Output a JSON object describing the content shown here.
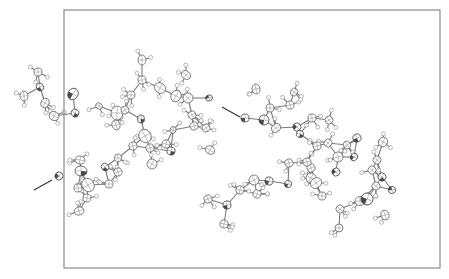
{
  "figure": {
    "type": "crystal-packing-diagram",
    "style": "ORTEP thermal ellipsoids with hydrogen atoms",
    "unit_cell_frame": {
      "x": 64,
      "y": 10,
      "width": 376,
      "height": 258
    },
    "colors": {
      "frame": "#8a8a8a",
      "bond": "#7a7a7a",
      "hbond": "#333333",
      "heteroatom_shade": "#4a4a4a",
      "background": "#ffffff"
    },
    "hydrogen_bonds": [
      {
        "label": "hbond-left",
        "x1": 34,
        "y1": 190,
        "x2": 52,
        "y2": 180
      },
      {
        "label": "hbond-center",
        "x1": 222,
        "y1": 107,
        "x2": 240,
        "y2": 117
      }
    ],
    "molecules": [
      {
        "label": "molecule-left",
        "heavy_atoms": [
          {
            "x": 40,
            "y": 87,
            "rx": 4,
            "ry": 3.5,
            "het": true
          },
          {
            "x": 24,
            "y": 96,
            "rx": 5,
            "ry": 4,
            "het": false
          },
          {
            "x": 38,
            "y": 72,
            "rx": 4,
            "ry": 4,
            "het": false
          },
          {
            "x": 45,
            "y": 103,
            "rx": 5,
            "ry": 4,
            "het": false
          },
          {
            "x": 54,
            "y": 116,
            "rx": 5,
            "ry": 4.5,
            "het": false
          },
          {
            "x": 73,
            "y": 94,
            "rx": 6,
            "ry": 5,
            "het": true
          },
          {
            "x": 75,
            "y": 113,
            "rx": 4,
            "ry": 4,
            "het": true
          },
          {
            "x": 99,
            "y": 106,
            "rx": 3.5,
            "ry": 3,
            "het": false
          },
          {
            "x": 117,
            "y": 113,
            "rx": 7,
            "ry": 6,
            "het": false
          },
          {
            "x": 125,
            "y": 110,
            "rx": 4,
            "ry": 4,
            "het": false
          },
          {
            "x": 131,
            "y": 95,
            "rx": 4,
            "ry": 4,
            "het": false
          },
          {
            "x": 142,
            "y": 80,
            "rx": 4,
            "ry": 4,
            "het": false
          },
          {
            "x": 142,
            "y": 60,
            "rx": 5,
            "ry": 4,
            "het": false
          },
          {
            "x": 141,
            "y": 119,
            "rx": 3.5,
            "ry": 4,
            "het": true
          },
          {
            "x": 116,
            "y": 125,
            "rx": 5,
            "ry": 4,
            "het": false
          },
          {
            "x": 160,
            "y": 88,
            "rx": 6,
            "ry": 5,
            "het": false
          },
          {
            "x": 176,
            "y": 96,
            "rx": 6,
            "ry": 5,
            "het": false
          },
          {
            "x": 186,
            "y": 75,
            "rx": 5,
            "ry": 4,
            "het": false
          },
          {
            "x": 188,
            "y": 98,
            "rx": 5,
            "ry": 5,
            "het": false
          },
          {
            "x": 192,
            "y": 115,
            "rx": 4,
            "ry": 4,
            "het": false
          },
          {
            "x": 209,
            "y": 98,
            "rx": 3.5,
            "ry": 3,
            "het": true
          },
          {
            "x": 173,
            "y": 130,
            "rx": 3.5,
            "ry": 3,
            "het": false
          },
          {
            "x": 194,
            "y": 126,
            "rx": 4,
            "ry": 4,
            "het": false
          },
          {
            "x": 206,
            "y": 128,
            "rx": 4,
            "ry": 4,
            "het": false
          },
          {
            "x": 210,
            "y": 150,
            "rx": 5,
            "ry": 4,
            "het": false
          },
          {
            "x": 145,
            "y": 136,
            "rx": 7,
            "ry": 6,
            "het": false
          },
          {
            "x": 133,
            "y": 146,
            "rx": 4,
            "ry": 4,
            "het": false
          },
          {
            "x": 150,
            "y": 148,
            "rx": 4,
            "ry": 4,
            "het": false
          },
          {
            "x": 166,
            "y": 144,
            "rx": 4,
            "ry": 4,
            "het": false
          },
          {
            "x": 171,
            "y": 151,
            "rx": 4,
            "ry": 4,
            "het": true
          },
          {
            "x": 152,
            "y": 164,
            "rx": 5,
            "ry": 5,
            "het": false
          },
          {
            "x": 118,
            "y": 158,
            "rx": 4,
            "ry": 3.5,
            "het": false
          },
          {
            "x": 105,
            "y": 167,
            "rx": 4,
            "ry": 3.5,
            "het": true
          },
          {
            "x": 118,
            "y": 172,
            "rx": 4,
            "ry": 4,
            "het": false
          },
          {
            "x": 109,
            "y": 184,
            "rx": 4,
            "ry": 4,
            "het": false
          },
          {
            "x": 88,
            "y": 185,
            "rx": 7,
            "ry": 6,
            "het": false
          },
          {
            "x": 81,
            "y": 171,
            "rx": 6,
            "ry": 5,
            "het": true
          },
          {
            "x": 80,
            "y": 160,
            "rx": 5,
            "ry": 4,
            "het": false
          },
          {
            "x": 59,
            "y": 176,
            "rx": 4,
            "ry": 4,
            "het": true
          },
          {
            "x": 78,
            "y": 188,
            "rx": 4,
            "ry": 4,
            "het": false
          },
          {
            "x": 87,
            "y": 198,
            "rx": 4,
            "ry": 4,
            "het": false
          },
          {
            "x": 79,
            "y": 211,
            "rx": 5,
            "ry": 4,
            "het": false
          }
        ]
      },
      {
        "label": "molecule-right",
        "heavy_atoms": [
          {
            "x": 245,
            "y": 118,
            "rx": 4,
            "ry": 4,
            "het": true
          },
          {
            "x": 256,
            "y": 89,
            "rx": 5,
            "ry": 4,
            "het": false
          },
          {
            "x": 264,
            "y": 120,
            "rx": 5,
            "ry": 5,
            "het": true
          },
          {
            "x": 270,
            "y": 108,
            "rx": 4,
            "ry": 4,
            "het": false
          },
          {
            "x": 276,
            "y": 128,
            "rx": 5,
            "ry": 4,
            "het": false
          },
          {
            "x": 290,
            "y": 105,
            "rx": 4,
            "ry": 4,
            "het": false
          },
          {
            "x": 294,
            "y": 92,
            "rx": 4,
            "ry": 3.5,
            "het": false
          },
          {
            "x": 297,
            "y": 127,
            "rx": 4,
            "ry": 4,
            "het": true
          },
          {
            "x": 300,
            "y": 134,
            "rx": 3.5,
            "ry": 3.5,
            "het": true
          },
          {
            "x": 312,
            "y": 118,
            "rx": 4,
            "ry": 4,
            "het": false
          },
          {
            "x": 329,
            "y": 120,
            "rx": 4,
            "ry": 4,
            "het": false
          },
          {
            "x": 317,
            "y": 146,
            "rx": 4,
            "ry": 4,
            "het": false
          },
          {
            "x": 328,
            "y": 143,
            "rx": 4,
            "ry": 4,
            "het": false
          },
          {
            "x": 347,
            "y": 145,
            "rx": 4,
            "ry": 3.5,
            "het": false
          },
          {
            "x": 357,
            "y": 138,
            "rx": 4,
            "ry": 4,
            "het": true
          },
          {
            "x": 338,
            "y": 157,
            "rx": 5,
            "ry": 5,
            "het": false
          },
          {
            "x": 354,
            "y": 157,
            "rx": 4,
            "ry": 3.5,
            "het": true
          },
          {
            "x": 311,
            "y": 168,
            "rx": 4,
            "ry": 4,
            "het": false
          },
          {
            "x": 307,
            "y": 162,
            "rx": 4,
            "ry": 4,
            "het": false
          },
          {
            "x": 289,
            "y": 163,
            "rx": 4,
            "ry": 4,
            "het": false
          },
          {
            "x": 336,
            "y": 172,
            "rx": 4,
            "ry": 4,
            "het": true
          },
          {
            "x": 311,
            "y": 178,
            "rx": 5,
            "ry": 5,
            "het": false
          },
          {
            "x": 316,
            "y": 183,
            "rx": 6,
            "ry": 5,
            "het": false
          },
          {
            "x": 288,
            "y": 184,
            "rx": 3.5,
            "ry": 3.5,
            "het": true
          },
          {
            "x": 269,
            "y": 181,
            "rx": 4,
            "ry": 4,
            "het": true
          },
          {
            "x": 254,
            "y": 180,
            "rx": 5,
            "ry": 5,
            "het": false
          },
          {
            "x": 257,
            "y": 194,
            "rx": 4,
            "ry": 4,
            "het": false
          },
          {
            "x": 240,
            "y": 190,
            "rx": 4,
            "ry": 4,
            "het": false
          },
          {
            "x": 227,
            "y": 205,
            "rx": 4,
            "ry": 4,
            "het": true
          },
          {
            "x": 208,
            "y": 199,
            "rx": 4,
            "ry": 4,
            "het": false
          },
          {
            "x": 224,
            "y": 224,
            "rx": 4,
            "ry": 4,
            "het": false
          },
          {
            "x": 322,
            "y": 196,
            "rx": 4,
            "ry": 4,
            "het": false
          },
          {
            "x": 340,
            "y": 209,
            "rx": 4,
            "ry": 4,
            "het": false
          },
          {
            "x": 339,
            "y": 228,
            "rx": 4,
            "ry": 4,
            "het": false
          },
          {
            "x": 360,
            "y": 201,
            "rx": 5,
            "ry": 4.5,
            "het": false
          },
          {
            "x": 367,
            "y": 199,
            "rx": 6,
            "ry": 6,
            "het": true
          },
          {
            "x": 376,
            "y": 186,
            "rx": 4,
            "ry": 4,
            "het": false
          },
          {
            "x": 382,
            "y": 177,
            "rx": 4,
            "ry": 4,
            "het": true
          },
          {
            "x": 392,
            "y": 190,
            "rx": 3.5,
            "ry": 3.5,
            "het": true
          },
          {
            "x": 372,
            "y": 170,
            "rx": 4,
            "ry": 4,
            "het": false
          },
          {
            "x": 377,
            "y": 160,
            "rx": 4,
            "ry": 4,
            "het": false
          },
          {
            "x": 383,
            "y": 142,
            "rx": 5,
            "ry": 4.5,
            "het": false
          },
          {
            "x": 385,
            "y": 215,
            "rx": 5,
            "ry": 4,
            "het": false
          }
        ]
      }
    ]
  }
}
